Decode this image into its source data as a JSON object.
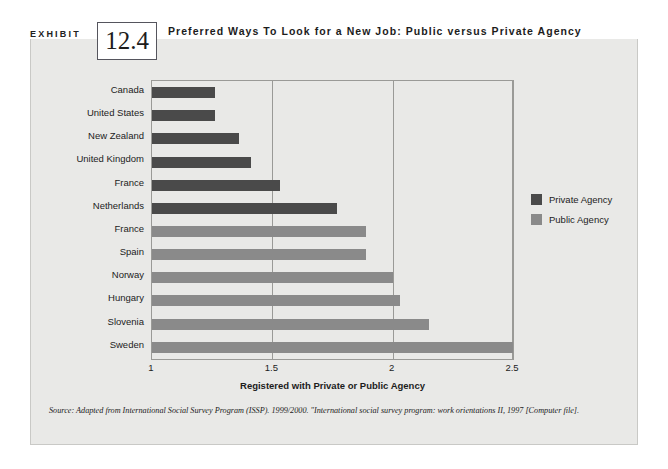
{
  "exhibit": {
    "label": "EXHIBIT",
    "number": "12.4",
    "title": "Preferred Ways To Look for a New Job: Public versus Private Agency"
  },
  "source": {
    "text": "Source: Adapted from International Social Survey Program (ISSP). 1999/2000. \"International social survey program: work orientations II, 1997 [Computer file]."
  },
  "colors": {
    "private": "#4a4a4a",
    "public": "#8a8a8a",
    "panel": "#e9e9e7",
    "band": "#4d4d55",
    "axis": "#9a9a97"
  },
  "chart_data": {
    "type": "bar",
    "orientation": "horizontal",
    "title": "Preferred Ways To Look for a New Job: Public versus Private Agency",
    "xlabel": "Registered with Private or Public Agency",
    "ylabel": "",
    "xlim": [
      1,
      2.5
    ],
    "xticks": [
      1,
      1.5,
      2,
      2.5
    ],
    "xtick_labels": [
      "1",
      "1.5",
      "2",
      "2.5"
    ],
    "grid": true,
    "legend_position": "right",
    "categories": [
      "Canada",
      "United States",
      "New Zealand",
      "United Kingdom",
      "France",
      "Netherlands",
      "France",
      "Spain",
      "Norway",
      "Hungary",
      "Slovenia",
      "Sweden"
    ],
    "values": [
      1.26,
      1.26,
      1.36,
      1.41,
      1.53,
      1.77,
      1.89,
      1.89,
      2.0,
      2.03,
      2.15,
      2.57
    ],
    "group": [
      "Private Agency",
      "Private Agency",
      "Private Agency",
      "Private Agency",
      "Private Agency",
      "Private Agency",
      "Public Agency",
      "Public Agency",
      "Public Agency",
      "Public Agency",
      "Public Agency",
      "Public Agency"
    ],
    "legend": [
      {
        "name": "Private Agency",
        "color": "#4a4a4a"
      },
      {
        "name": "Public Agency",
        "color": "#8a8a8a"
      }
    ]
  }
}
